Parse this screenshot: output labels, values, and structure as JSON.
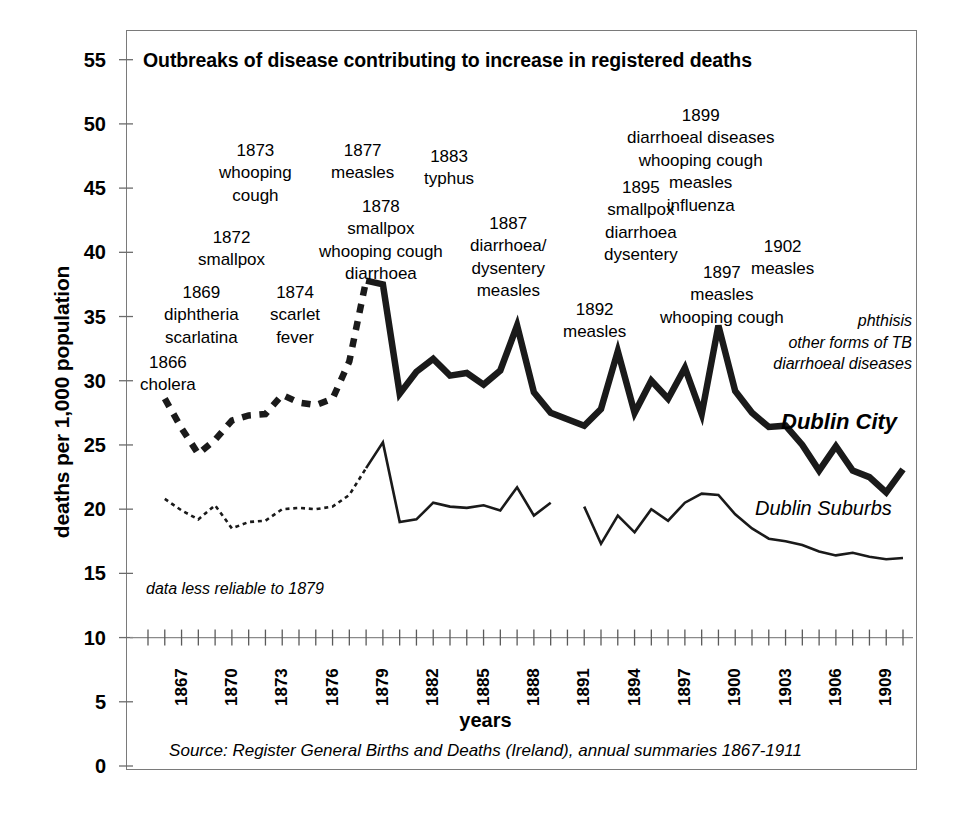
{
  "chart_data": {
    "type": "line",
    "title": "Outbreaks of disease contributing to increase in registered deaths",
    "xlabel": "years",
    "ylabel": "deaths per 1,000 population",
    "ylim": [
      0,
      57
    ],
    "xlim": [
      1866,
      1911
    ],
    "ytick_step": 5,
    "yticks": [
      "0",
      "5",
      "10",
      "15",
      "20",
      "25",
      "30",
      "35",
      "40",
      "45",
      "50",
      "55"
    ],
    "xticks": [
      "1867",
      "1870",
      "1873",
      "1876",
      "1879",
      "1882",
      "1885",
      "1888",
      "1891",
      "1894",
      "1897",
      "1900",
      "1903",
      "1906",
      "1909"
    ],
    "xtick_start": 1867,
    "xtick_step": 3,
    "grid": false,
    "legend_position": "inline-right",
    "source": "Source: Register General Births and Deaths (Ireland), annual summaries 1867-1911",
    "series": [
      {
        "name": "Dublin City",
        "style": "thick",
        "x": [
          1867,
          1868,
          1869,
          1870,
          1871,
          1872,
          1873,
          1874,
          1875,
          1876,
          1877,
          1878,
          1879,
          1880,
          1881,
          1882,
          1883,
          1884,
          1885,
          1886,
          1887,
          1888,
          1889,
          1890,
          1891,
          1892,
          1893,
          1894,
          1895,
          1896,
          1897,
          1898,
          1899,
          1900,
          1901,
          1902,
          1903,
          1904,
          1905,
          1906,
          1907,
          1908,
          1909,
          1910,
          1911
        ],
        "values": [
          28.6,
          26.3,
          24.3,
          25.4,
          26.9,
          27.3,
          27.4,
          28.9,
          28.3,
          28.1,
          28.6,
          31.5,
          37.8,
          37.5,
          29.0,
          30.7,
          31.7,
          30.4,
          30.6,
          29.7,
          30.8,
          34.3,
          29.1,
          27.5,
          27.0,
          26.5,
          27.8,
          32.3,
          27.5,
          30.0,
          28.6,
          31.0,
          27.4,
          34.3,
          29.2,
          27.5,
          26.4,
          26.5,
          25.0,
          23.0,
          24.9,
          23.0,
          22.5,
          21.3,
          23.1
        ]
      },
      {
        "name": "Dublin Suburbs",
        "style": "thin",
        "x": [
          1867,
          1868,
          1869,
          1870,
          1871,
          1872,
          1873,
          1874,
          1875,
          1876,
          1877,
          1878,
          1879,
          1880,
          1881,
          1882,
          1883,
          1884,
          1885,
          1886,
          1887,
          1888,
          1889,
          1890,
          1892,
          1893,
          1894,
          1895,
          1896,
          1897,
          1898,
          1899,
          1900,
          1901,
          1902,
          1903,
          1904,
          1905,
          1906,
          1907,
          1908,
          1909,
          1910,
          1911
        ],
        "values": [
          20.8,
          19.9,
          19.2,
          20.3,
          18.5,
          19.0,
          19.1,
          20.0,
          20.1,
          20.0,
          20.2,
          21.1,
          23.2,
          25.2,
          19.0,
          19.2,
          20.5,
          20.2,
          20.1,
          20.3,
          19.9,
          21.7,
          19.5,
          20.5,
          20.2,
          17.3,
          19.5,
          18.2,
          20.0,
          19.1,
          20.5,
          21.2,
          21.1,
          19.6,
          18.5,
          17.7,
          17.5,
          17.2,
          16.7,
          16.4,
          16.6,
          16.3,
          16.1,
          16.2
        ]
      }
    ],
    "annotations": [
      {
        "id": "a1866",
        "year": "1866",
        "lines": [
          "cholera"
        ],
        "x": 140,
        "y": 352
      },
      {
        "id": "a1869",
        "year": "1869",
        "lines": [
          "diphtheria",
          "scarlatina"
        ],
        "x": 164,
        "y": 282
      },
      {
        "id": "a1872",
        "year": "1872",
        "lines": [
          "smallpox"
        ],
        "x": 198,
        "y": 227
      },
      {
        "id": "a1873",
        "year": "1873",
        "lines": [
          "whooping",
          "cough"
        ],
        "x": 219,
        "y": 140
      },
      {
        "id": "a1874",
        "year": "1874",
        "lines": [
          "scarlet",
          "fever"
        ],
        "x": 270,
        "y": 282
      },
      {
        "id": "a1877",
        "year": "1877",
        "lines": [
          "measles"
        ],
        "x": 331,
        "y": 140
      },
      {
        "id": "a1878",
        "year": "1878",
        "lines": [
          "smallpox",
          "whooping cough",
          "diarrhoea"
        ],
        "x": 319,
        "y": 196
      },
      {
        "id": "a1883",
        "year": "1883",
        "lines": [
          "typhus"
        ],
        "x": 424,
        "y": 146
      },
      {
        "id": "a1887",
        "year": "1887",
        "lines": [
          "diarrhoea/",
          "dysentery",
          "measles"
        ],
        "x": 470,
        "y": 213
      },
      {
        "id": "a1892",
        "year": "1892",
        "lines": [
          "measles"
        ],
        "x": 563,
        "y": 299
      },
      {
        "id": "a1895",
        "year": "1895",
        "lines": [
          "smallpox",
          "diarrhoea",
          "dysentery"
        ],
        "x": 604,
        "y": 177
      },
      {
        "id": "a1897",
        "year": "1897",
        "lines": [
          "measles",
          "whooping cough"
        ],
        "x": 660,
        "y": 262
      },
      {
        "id": "a1899",
        "year": "1899",
        "lines": [
          "diarrhoeal diseases",
          "whooping cough",
          "measles",
          "influenza"
        ],
        "x": 627,
        "y": 105
      },
      {
        "id": "a1902",
        "year": "1902",
        "lines": [
          "measles"
        ],
        "x": 751,
        "y": 236
      }
    ],
    "notes": {
      "reliability": "data less reliable to 1879",
      "right_causes": [
        "phthisis",
        "other forms of TB",
        "diarrhoeal diseases"
      ]
    }
  }
}
